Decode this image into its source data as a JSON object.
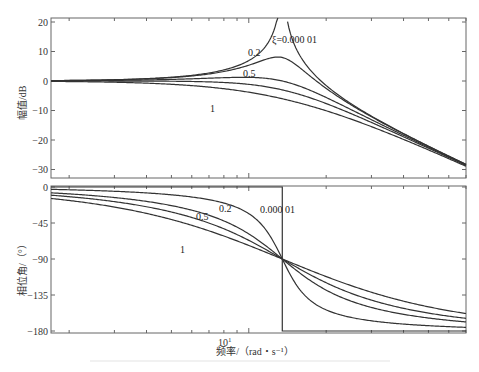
{
  "chart_data": [
    {
      "type": "line",
      "title": "",
      "xlabel": "",
      "ylabel": "幅值/dB",
      "xscale": "log",
      "ylim": [
        -33,
        21
      ],
      "yticks": [
        20,
        10,
        0,
        -10,
        -20,
        -30
      ],
      "grid": false,
      "natural_frequency_rad_s": 13.5,
      "x_range_rad_s": [
        1.7,
        70
      ],
      "series": [
        {
          "name": "ξ=0.000 01",
          "damping": 1e-05,
          "peak_db": "→∞ at ωn"
        },
        {
          "name": "0.2",
          "damping": 0.2,
          "peak_db": 8.1
        },
        {
          "name": "0.5",
          "damping": 0.5,
          "peak_db": 1.2
        },
        {
          "name": "0.707",
          "damping": 0.707,
          "peak_db": 0
        },
        {
          "name": "1",
          "damping": 1,
          "peak_db": 0
        }
      ],
      "annotations": [
        "ξ=0.000 01",
        "0.2",
        "0.5",
        "1"
      ],
      "high_freq_end_db": -32
    },
    {
      "type": "line",
      "title": "",
      "xlabel": "频率/（rad・s⁻¹）",
      "ylabel": "相位角/（°）",
      "xscale": "log",
      "ylim": [
        -182,
        0
      ],
      "yticks": [
        0,
        -45,
        -90,
        -135,
        -180
      ],
      "xticks_labeled": [
        "10¹"
      ],
      "grid": false,
      "series": [
        {
          "name": "0.000 01",
          "damping": 1e-05,
          "phase_at_wn_deg": -90,
          "shape": "step 0 → -180 at ωn"
        },
        {
          "name": "0.2",
          "damping": 0.2,
          "phase_at_wn_deg": -90
        },
        {
          "name": "0.5",
          "damping": 0.5,
          "phase_at_wn_deg": -90
        },
        {
          "name": "0.707",
          "damping": 0.707,
          "phase_at_wn_deg": -90
        },
        {
          "name": "1",
          "damping": 1,
          "phase_at_wn_deg": -90
        }
      ],
      "annotations": [
        "0.000 01",
        "0.2",
        "0.5",
        "1"
      ]
    }
  ],
  "labels": {
    "mag_ylabel": "幅值/dB",
    "phase_ylabel": "相位角/（°）",
    "xlabel": "频率/（rad・s⁻¹）",
    "xtick_main": "10",
    "xtick_exp": "1",
    "mag_yticks": [
      "20",
      "10",
      "0",
      "−10",
      "−20",
      "−30"
    ],
    "phase_yticks": [
      "0",
      "−45",
      "−90",
      "−135",
      "−180"
    ],
    "mag_annot_xi": "ξ=0.000 01",
    "mag_annot_02": "0.2",
    "mag_annot_05": "0.5",
    "mag_annot_1": "1",
    "phase_annot_xi": "0.000 01",
    "phase_annot_02": "0.2",
    "phase_annot_05": "0.5",
    "phase_annot_1": "1"
  },
  "colors": {
    "line": "#333333",
    "axis": "#555555",
    "background": "#ffffff"
  }
}
